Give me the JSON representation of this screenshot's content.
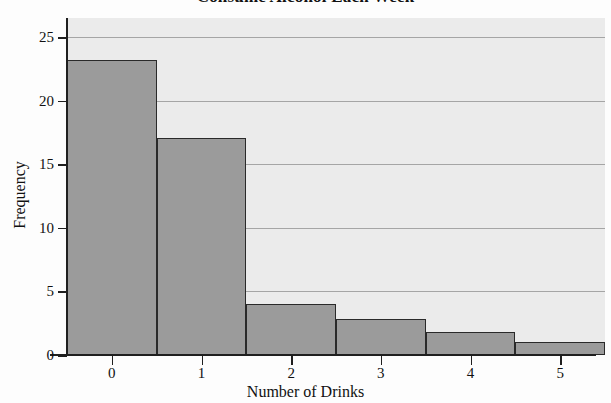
{
  "chart_data": {
    "type": "bar",
    "title": "Consume Alcohol Each Week",
    "xlabel": "Number of Drinks",
    "ylabel": "Frequency",
    "categories": [
      "0",
      "1",
      "2",
      "3",
      "4",
      "5"
    ],
    "values": [
      23.2,
      17.1,
      4.0,
      2.8,
      1.8,
      1.0
    ],
    "xlim": [
      -0.5,
      5.5
    ],
    "ylim": [
      0,
      26.5
    ],
    "yticks": [
      0,
      5,
      10,
      15,
      20,
      25
    ],
    "ytick_labels": [
      "0",
      "5",
      "10",
      "15",
      "20",
      "25"
    ],
    "xticks": [
      0,
      1,
      2,
      3,
      4,
      5
    ],
    "xtick_labels": [
      "0",
      "1",
      "2",
      "3",
      "4",
      "5"
    ],
    "grid": true,
    "grid_axis": "y",
    "legend": null,
    "bar_fill_color": "#9b9b9b",
    "bar_edge_color": "#2a2a2a",
    "plot_background_color": "#ebebeb",
    "gridline_color": "#8e8e8e",
    "axis_color": "#1f1f1f",
    "bar_gap": 0,
    "note": "contiguous histogram bars"
  }
}
